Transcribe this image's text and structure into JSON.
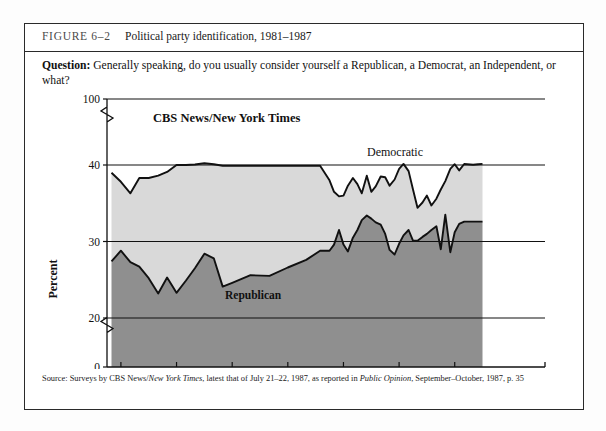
{
  "figure": {
    "label": "FIGURE 6–2",
    "title": "Political party identification, 1981–1987",
    "question_prefix": "Question:",
    "question_text": "Generally speaking, do you usually consider yourself a Republican, a Democrat, an Independent, or what?",
    "source_parts": {
      "p1": "Source: Surveys by CBS News/",
      "p2_italic": "New York Times",
      "p3": ", latest that of July 21–22, 1987, as reported in ",
      "p4_italic": "Public Opinion",
      "p5": ", September–October, 1987, p. 35"
    }
  },
  "chart_data": {
    "type": "area",
    "title": "Political party identification, 1981–1987",
    "annotation_pollster": "CBS News/New York Times",
    "xlabel": "",
    "ylabel": "Percent",
    "ylim": [
      0,
      100
    ],
    "y_ticks": [
      "100",
      "40",
      "30",
      "20",
      "0"
    ],
    "y_tick_values": [
      100,
      40,
      30,
      20,
      0
    ],
    "axis_breaks": [
      "between 100 and 40",
      "between 20 and 0"
    ],
    "grid": true,
    "grid_lines_at": [
      40,
      30,
      20
    ],
    "x_ticks": [
      "1981",
      "1982",
      "1983",
      "1984",
      "1985",
      "1986",
      "1987"
    ],
    "legend_position": "inline-labels",
    "colors": {
      "democratic_band": "#d9d9d9",
      "republican_band": "#8f8f8f",
      "line": "#111111",
      "frame": "#2a2a2a"
    },
    "series": [
      {
        "name": "Democratic",
        "label_text": "Democratic",
        "note": "upper boundary of light band; percent identifying as Democrat",
        "x": [
          1980.83,
          1981.0,
          1981.17,
          1981.33,
          1981.5,
          1981.67,
          1981.83,
          1982.0,
          1982.17,
          1982.33,
          1982.5,
          1982.67,
          1982.83,
          1983.0,
          1983.33,
          1983.67,
          1984.0,
          1984.33,
          1984.58,
          1984.75,
          1984.83,
          1984.92,
          1985.0,
          1985.08,
          1985.17,
          1985.25,
          1985.33,
          1985.42,
          1985.5,
          1985.58,
          1985.67,
          1985.75,
          1985.83,
          1985.92,
          1986.0,
          1986.08,
          1986.17,
          1986.25,
          1986.33,
          1986.42,
          1986.5,
          1986.58,
          1986.67,
          1986.75,
          1986.83,
          1986.92,
          1987.0,
          1987.08,
          1987.17,
          1987.33,
          1987.42,
          1987.5
        ],
        "values": [
          39.0,
          37.8,
          36.3,
          38.3,
          38.3,
          38.6,
          39.1,
          40.0,
          40.0,
          40.5,
          41.6,
          40.6,
          39.9,
          39.9,
          39.9,
          39.9,
          39.9,
          39.9,
          39.9,
          38.0,
          36.5,
          35.9,
          36.0,
          37.3,
          38.3,
          37.5,
          36.3,
          38.6,
          36.5,
          37.2,
          38.5,
          38.4,
          37.3,
          38.1,
          39.5,
          41.0,
          39.2,
          36.8,
          34.4,
          35.1,
          36.0,
          34.7,
          35.6,
          36.8,
          37.9,
          39.5,
          40.7,
          39.3,
          40.9,
          40.2,
          40.6,
          41.0
        ]
      },
      {
        "name": "Republican",
        "label_text": "Republican",
        "note": "upper boundary of dark band; percent identifying as Republican",
        "x": [
          1980.83,
          1981.0,
          1981.17,
          1981.33,
          1981.5,
          1981.67,
          1981.83,
          1982.0,
          1982.17,
          1982.33,
          1982.5,
          1982.67,
          1982.83,
          1983.0,
          1983.33,
          1983.67,
          1984.0,
          1984.33,
          1984.58,
          1984.75,
          1984.83,
          1984.92,
          1985.0,
          1985.08,
          1985.17,
          1985.25,
          1985.33,
          1985.42,
          1985.5,
          1985.58,
          1985.67,
          1985.75,
          1985.83,
          1985.92,
          1986.0,
          1986.08,
          1986.17,
          1986.25,
          1986.33,
          1986.42,
          1986.5,
          1986.58,
          1986.67,
          1986.75,
          1986.83,
          1986.92,
          1987.0,
          1987.08,
          1987.17,
          1987.33,
          1987.42,
          1987.5
        ],
        "values": [
          27.4,
          28.8,
          27.3,
          26.7,
          25.2,
          23.2,
          25.3,
          23.3,
          24.9,
          26.5,
          28.4,
          27.8,
          24.1,
          24.6,
          25.6,
          25.5,
          26.6,
          27.6,
          28.8,
          28.8,
          29.6,
          31.5,
          29.6,
          28.7,
          30.5,
          31.5,
          32.8,
          33.4,
          33.0,
          32.5,
          32.2,
          31.0,
          28.9,
          28.3,
          29.7,
          30.8,
          31.5,
          30.1,
          30.1,
          30.6,
          31.0,
          31.5,
          32.0,
          29.0,
          33.5,
          28.6,
          31.2,
          32.3,
          32.6,
          32.6,
          32.6,
          32.6
        ]
      }
    ]
  }
}
